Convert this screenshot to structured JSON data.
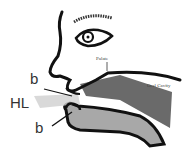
{
  "diagram": {
    "labels": {
      "palate": "Palate",
      "oral_cavity": "Oral Cavity",
      "b_upper": "b",
      "hl": "HL",
      "b_lower": "b"
    },
    "colors": {
      "outline": "#111111",
      "tongue_upper": "#6a6a6a",
      "tongue_lower": "#a8a8a8",
      "airflow": "#c8c8c8"
    }
  }
}
